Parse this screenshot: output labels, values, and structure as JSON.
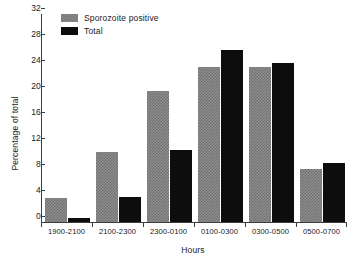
{
  "chart_data": {
    "type": "bar",
    "title": "",
    "subtitle": "",
    "xlabel": "Hours",
    "ylabel": "Percentage of total",
    "categories": [
      "1900-2100",
      "2100-2300",
      "2300-0100",
      "0100-0300",
      "0300-0500",
      "0500-0700"
    ],
    "series": [
      {
        "name": "Sporozoite positive",
        "color": "#8e8e8e",
        "pattern": "checkerboard",
        "values": [
          3.7,
          10.7,
          20.1,
          23.8,
          23.8,
          8.2
        ]
      },
      {
        "name": "Total",
        "color": "#0d0d0d",
        "pattern": "solid",
        "values": [
          0.6,
          3.8,
          11.1,
          26.4,
          24.4,
          9.1
        ]
      }
    ],
    "ylim": [
      0,
      32
    ],
    "yticks": [
      0,
      4,
      8,
      12,
      16,
      20,
      24,
      28,
      32
    ],
    "ytick_labels": [
      "0",
      "4",
      "8",
      "12",
      "16",
      "20",
      "24",
      "28",
      "32"
    ],
    "grid": false,
    "legend_position": "top-left-inside",
    "orientation": "vertical",
    "grouping": "grouped"
  }
}
